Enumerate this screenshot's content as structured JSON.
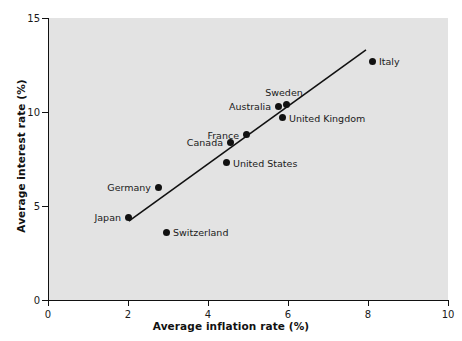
{
  "chart_data": {
    "type": "scatter",
    "title": "",
    "xlabel": "Average inflation rate (%)",
    "ylabel": "Average interest rate (%)",
    "xlim": [
      0,
      10
    ],
    "ylim": [
      0,
      15
    ],
    "xticks": [
      "0",
      "2",
      "4",
      "6",
      "8",
      "10"
    ],
    "xtick_values": [
      0,
      2,
      4,
      6,
      8,
      10
    ],
    "yticks": [
      "0",
      "5",
      "10",
      "15"
    ],
    "ytick_values": [
      0,
      5,
      10,
      15
    ],
    "grid": false,
    "legend": "none",
    "plot_background": "#e3e3e3",
    "marker_color": "#111111",
    "trendline_color": "#111111",
    "points": [
      {
        "name": "Japan",
        "x": 2.0,
        "y": 4.4,
        "label": "Japan",
        "label_side": "left"
      },
      {
        "name": "Germany",
        "x": 2.75,
        "y": 6.0,
        "label": "Germany",
        "label_side": "left"
      },
      {
        "name": "Switzerland",
        "x": 2.95,
        "y": 3.6,
        "label": "Switzerland",
        "label_side": "right"
      },
      {
        "name": "United States",
        "x": 4.45,
        "y": 7.3,
        "label": "United States",
        "label_side": "right"
      },
      {
        "name": "Canada",
        "x": 4.55,
        "y": 8.4,
        "label": "Canada",
        "label_side": "left"
      },
      {
        "name": "France",
        "x": 4.95,
        "y": 8.8,
        "label": "France",
        "label_side": "left"
      },
      {
        "name": "Australia",
        "x": 5.75,
        "y": 10.3,
        "label": "Australia",
        "label_side": "left"
      },
      {
        "name": "Sweden",
        "x": 5.95,
        "y": 10.4,
        "label": "Sweden",
        "label_side": "above"
      },
      {
        "name": "United Kingdom",
        "x": 5.85,
        "y": 9.7,
        "label": "United Kingdom",
        "label_side": "right"
      },
      {
        "name": "Italy",
        "x": 8.1,
        "y": 12.7,
        "label": "Italy",
        "label_side": "right"
      }
    ],
    "trendline": {
      "x0": 2.02,
      "y0": 4.2,
      "x1": 7.95,
      "y1": 13.3
    }
  }
}
